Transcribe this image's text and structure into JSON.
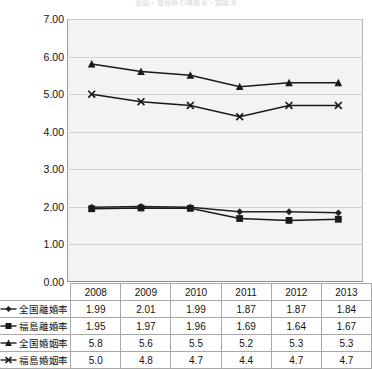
{
  "chart_data": {
    "type": "line",
    "title": "全国・福島県の離婚率・婚姻率",
    "xlabel": "",
    "ylabel": "",
    "categories": [
      "2008",
      "2009",
      "2010",
      "2011",
      "2012",
      "2013"
    ],
    "ylim": [
      0.0,
      7.0
    ],
    "ytick_step": 1.0,
    "ytick_labels": [
      "7.00",
      "6.00",
      "5.00",
      "4.00",
      "3.00",
      "2.00",
      "1.00",
      "0.00"
    ],
    "ytick_values": [
      7.0,
      6.0,
      5.0,
      4.0,
      3.0,
      2.0,
      1.0,
      0.0
    ],
    "grid": true,
    "legend_position": "table-left",
    "series": [
      {
        "name": "全国離婚率",
        "marker": "diamond",
        "color": "#222222",
        "values": [
          1.99,
          2.01,
          1.99,
          1.87,
          1.87,
          1.84
        ],
        "display_values": [
          "1.99",
          "2.01",
          "1.99",
          "1.87",
          "1.87",
          "1.84"
        ]
      },
      {
        "name": "福島離婚率",
        "marker": "square",
        "color": "#1a1a1a",
        "values": [
          1.95,
          1.97,
          1.96,
          1.69,
          1.64,
          1.67
        ],
        "display_values": [
          "1.95",
          "1.97",
          "1.96",
          "1.69",
          "1.64",
          "1.67"
        ]
      },
      {
        "name": "全国婚姻率",
        "marker": "triangle",
        "color": "#1a1a1a",
        "values": [
          5.8,
          5.6,
          5.5,
          5.2,
          5.3,
          5.3
        ],
        "display_values": [
          "5.8",
          "5.6",
          "5.5",
          "5.2",
          "5.3",
          "5.3"
        ]
      },
      {
        "name": "福島婚姻率",
        "marker": "x",
        "color": "#1a1a1a",
        "values": [
          5.0,
          4.8,
          4.7,
          4.4,
          4.7,
          4.7
        ],
        "display_values": [
          "5.0",
          "4.8",
          "4.7",
          "4.4",
          "4.7",
          "4.7"
        ]
      }
    ]
  },
  "colors": {
    "plot_background": "#f3f3f3",
    "gridline": "#d2d2d2",
    "axis": "#8f8f8f",
    "series_line": "#1a1a1a",
    "table_border": "#a8a8a8",
    "page_background": "#ffffff"
  }
}
